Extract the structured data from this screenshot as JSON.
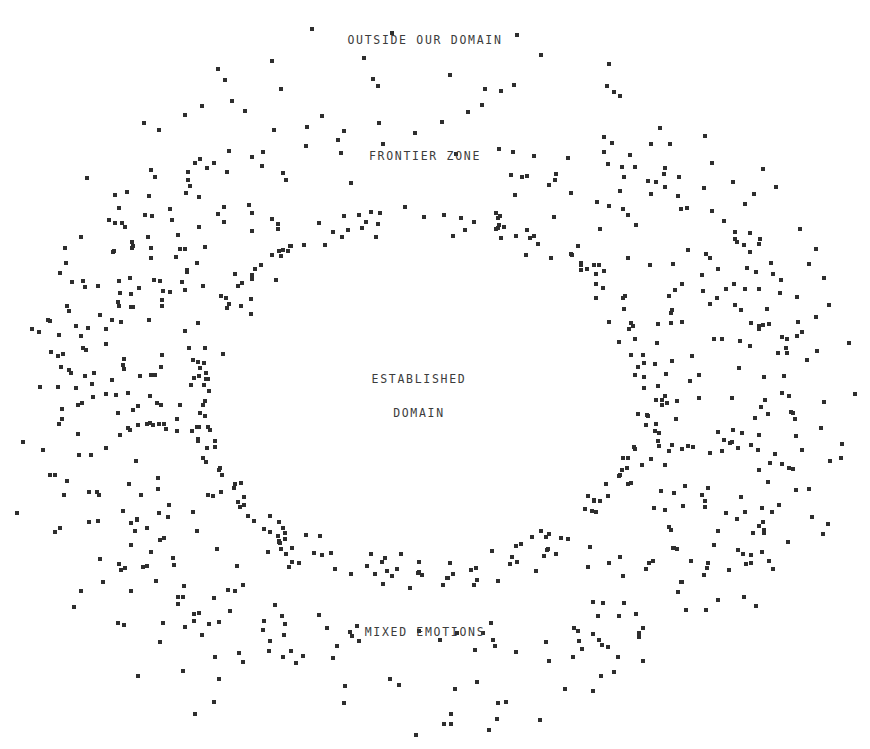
{
  "canvas": {
    "width": 870,
    "height": 749,
    "background": "#ffffff"
  },
  "style": {
    "dot_color": "#2e2e2e",
    "dot_size_px": 4,
    "label_color": "#3c3c3c",
    "label_font_size_px": 11.5,
    "label_letter_spacing_px": 1.7
  },
  "labels": {
    "outer": "OUTSIDE OUR DOMAIN",
    "frontier": "FRONTIER ZONE",
    "core_line1": "ESTABLISHED",
    "core_line2": "DOMAIN",
    "bottom": "MIXED EMOTIONS"
  },
  "label_positions": {
    "outer": {
      "x": 425,
      "y": 40
    },
    "frontier": {
      "x": 425,
      "y": 156
    },
    "core": {
      "x": 419,
      "y": 396
    },
    "bottom": {
      "x": 425,
      "y": 632
    }
  },
  "chart_data": {
    "type": "scatter",
    "title": "OUTSIDE OUR DOMAIN",
    "xlabel": "",
    "ylabel": "",
    "xlim": [
      0,
      870
    ],
    "ylim": [
      0,
      749
    ],
    "grid": false,
    "legend": "none",
    "annotations": [
      {
        "text": "OUTSIDE OUR DOMAIN",
        "x": 425,
        "y": 40
      },
      {
        "text": "FRONTIER ZONE",
        "x": 425,
        "y": 156
      },
      {
        "text": "ESTABLISHED",
        "x": 419,
        "y": 396
      },
      {
        "text": "DOMAIN",
        "x": 419,
        "y": 432
      },
      {
        "text": "MIXED EMOTIONS",
        "x": 425,
        "y": 632
      }
    ],
    "series": [
      {
        "name": "outer-boundary-band",
        "marker": "square",
        "marker_size": 4,
        "color": "#2e2e2e",
        "point_count": 620,
        "shape": "ellipse-annulus",
        "center": [
          432,
          392
        ],
        "radius_x": 392,
        "radius_y": 338,
        "band_thickness": 0.3,
        "jitter": 16,
        "density_profile": "heavier on left and right flanks, sparser at top and bottom"
      },
      {
        "name": "inner-boundary-band",
        "marker": "square",
        "marker_size": 4,
        "color": "#2e2e2e",
        "point_count": 235,
        "shape": "ellipse-annulus",
        "center": [
          425,
          396
        ],
        "radius_x": 238,
        "radius_y": 185,
        "band_thickness": 0.085,
        "jitter": 9,
        "density_profile": "fairly uniform thin ring"
      }
    ]
  }
}
